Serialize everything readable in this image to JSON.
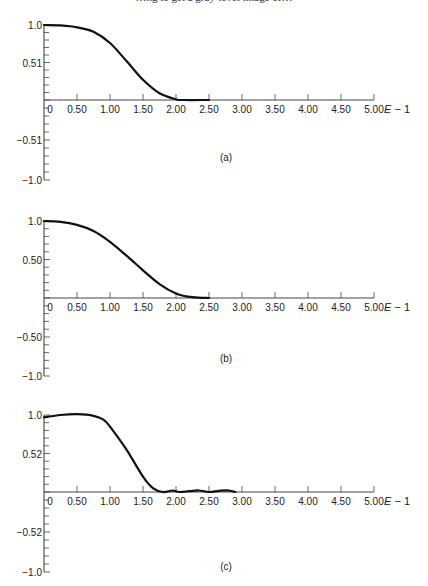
{
  "header": {
    "text": "…ng to get a gray-level image of…"
  },
  "chart_data": [
    {
      "type": "line",
      "panel_label": "(a)",
      "title": "",
      "xlabel": "E − 1",
      "ylabel": "",
      "xlim": [
        0,
        5.0
      ],
      "ylim": [
        -1.0,
        1.0
      ],
      "x_ticks": [
        "0",
        "0.50",
        "1.00",
        "1.50",
        "2.00",
        "2.50",
        "3.00",
        "3.50",
        "4.00",
        "4.50",
        "5.00"
      ],
      "y_ticks": [
        "1.0",
        "0.51",
        "−0.51",
        "−1.0"
      ],
      "grid": false,
      "x": [
        0,
        0.25,
        0.5,
        0.75,
        1.0,
        1.25,
        1.5,
        1.75,
        2.0,
        2.1,
        2.5
      ],
      "y": [
        1.0,
        0.995,
        0.97,
        0.91,
        0.76,
        0.52,
        0.27,
        0.09,
        0.01,
        0.0,
        0.0
      ]
    },
    {
      "type": "line",
      "panel_label": "(b)",
      "title": "",
      "xlabel": "E − 1",
      "ylabel": "",
      "xlim": [
        0,
        5.0
      ],
      "ylim": [
        -1.0,
        1.0
      ],
      "x_ticks": [
        "0",
        "0.50",
        "1.00",
        "1.50",
        "2.00",
        "2.50",
        "3.00",
        "3.50",
        "4.00",
        "4.50",
        "5.00"
      ],
      "y_ticks": [
        "1.0",
        "0.50",
        "−0.50",
        "−1.0"
      ],
      "grid": false,
      "x": [
        0,
        0.25,
        0.5,
        0.75,
        1.0,
        1.25,
        1.5,
        1.75,
        2.0,
        2.25,
        2.5
      ],
      "y": [
        1.0,
        0.99,
        0.95,
        0.87,
        0.73,
        0.55,
        0.36,
        0.18,
        0.06,
        0.01,
        0.0
      ]
    },
    {
      "type": "line",
      "panel_label": "(c)",
      "title": "",
      "xlabel": "E − 1",
      "ylabel": "",
      "xlim": [
        0,
        5.0
      ],
      "ylim": [
        -1.0,
        1.0
      ],
      "x_ticks": [
        "0",
        "0.50",
        "1.00",
        "1.50",
        "2.00",
        "2.50",
        "3.00",
        "3.50",
        "4.00",
        "4.50",
        "5.00"
      ],
      "y_ticks": [
        "1.0",
        "0.52",
        "−0.52",
        "−1.0"
      ],
      "grid": false,
      "x": [
        0,
        0.25,
        0.5,
        0.75,
        0.9,
        1.0,
        1.25,
        1.5,
        1.65,
        1.8,
        1.95,
        2.05,
        2.2,
        2.35,
        2.5,
        2.65,
        2.8,
        2.9
      ],
      "y": [
        0.97,
        1.0,
        1.01,
        0.99,
        0.94,
        0.85,
        0.55,
        0.2,
        0.05,
        0.0,
        0.02,
        0.0,
        0.01,
        0.02,
        0.0,
        0.015,
        0.02,
        0.0
      ]
    }
  ],
  "panels": [
    {
      "label": "(a)",
      "top": 25,
      "zero": 100,
      "bottom": 180,
      "caption_y": 161,
      "ticks": [
        "1.0",
        "0.51",
        "−0.51",
        "−1.0"
      ]
    },
    {
      "label": "(b)",
      "top": 221,
      "zero": 298,
      "bottom": 376,
      "caption_y": 362,
      "ticks": [
        "1.0",
        "0.50",
        "−0.50",
        "−1.0"
      ]
    },
    {
      "label": "(c)",
      "top": 415,
      "zero": 492,
      "bottom": 572,
      "caption_y": 570,
      "ticks": [
        "1.0",
        "0.52",
        "−0.52",
        "−1.0"
      ]
    }
  ],
  "x_axis_title_main": "E",
  "x_axis_title_suffix": " − 1"
}
